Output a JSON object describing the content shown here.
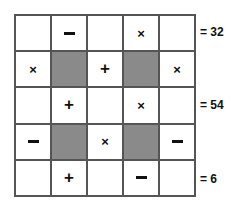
{
  "puzzle": {
    "type": "arithmetic-operator-grid",
    "rows": 5,
    "columns": 5,
    "shaded_color": "#8a8a8a",
    "cell_color": "#ffffff",
    "border_color": "#555555",
    "grid": [
      [
        {
          "symbol": "",
          "icon": "empty",
          "shaded": false
        },
        {
          "symbol": "−",
          "icon": "minus-icon",
          "shaded": false
        },
        {
          "symbol": "",
          "icon": "empty",
          "shaded": false
        },
        {
          "symbol": "×",
          "icon": "times-icon",
          "shaded": false
        },
        {
          "symbol": "",
          "icon": "empty",
          "shaded": false
        }
      ],
      [
        {
          "symbol": "×",
          "icon": "times-icon",
          "shaded": false
        },
        {
          "symbol": "",
          "icon": "empty",
          "shaded": true
        },
        {
          "symbol": "+",
          "icon": "plus-icon",
          "shaded": false
        },
        {
          "symbol": "",
          "icon": "empty",
          "shaded": true
        },
        {
          "symbol": "×",
          "icon": "times-icon",
          "shaded": false
        }
      ],
      [
        {
          "symbol": "",
          "icon": "empty",
          "shaded": false
        },
        {
          "symbol": "+",
          "icon": "plus-icon",
          "shaded": false
        },
        {
          "symbol": "",
          "icon": "empty",
          "shaded": false
        },
        {
          "symbol": "×",
          "icon": "times-icon",
          "shaded": false
        },
        {
          "symbol": "",
          "icon": "empty",
          "shaded": false
        }
      ],
      [
        {
          "symbol": "−",
          "icon": "minus-icon",
          "shaded": false
        },
        {
          "symbol": "",
          "icon": "empty",
          "shaded": true
        },
        {
          "symbol": "×",
          "icon": "times-icon",
          "shaded": false
        },
        {
          "symbol": "",
          "icon": "empty",
          "shaded": true
        },
        {
          "symbol": "−",
          "icon": "minus-icon",
          "shaded": false
        }
      ],
      [
        {
          "symbol": "",
          "icon": "empty",
          "shaded": false
        },
        {
          "symbol": "+",
          "icon": "plus-icon",
          "shaded": false
        },
        {
          "symbol": "",
          "icon": "empty",
          "shaded": false
        },
        {
          "symbol": "−",
          "icon": "minus-icon",
          "shaded": false
        },
        {
          "symbol": "",
          "icon": "empty",
          "shaded": false
        }
      ]
    ],
    "row_sums": [
      {
        "row": 1,
        "label": "= 32",
        "value": 32
      },
      {
        "row": 3,
        "label": "= 54",
        "value": 54
      },
      {
        "row": 5,
        "label": "= 6",
        "value": 6
      }
    ]
  }
}
